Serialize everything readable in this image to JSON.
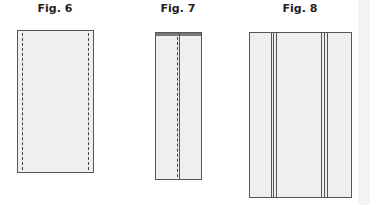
{
  "figures": [
    {
      "id": "fig6",
      "title": "Fig. 6",
      "description": "Fabric panel with two dashed stitch lines near the long edges"
    },
    {
      "id": "fig7",
      "title": "Fig. 7",
      "description": "Folded narrow panel with center seam (dashed stitch line beside a solid fold line), dark top edge"
    },
    {
      "id": "fig8",
      "title": "Fig. 8",
      "description": "Wide panel with two groups of triple vertical seam lines"
    }
  ],
  "colors": {
    "panel_fill": "#efefef",
    "outline": "#555555",
    "stitch": "#444444",
    "title": "#222222"
  }
}
